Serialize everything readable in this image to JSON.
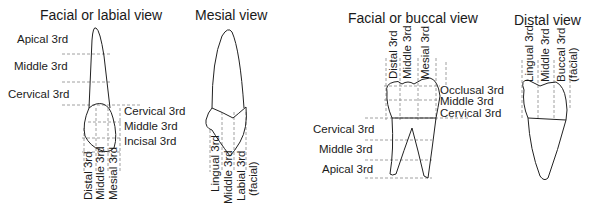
{
  "panels": [
    {
      "title": "Facial or labial view",
      "horizontal_labels": [
        "Apical 3rd",
        "Middle 3rd",
        "Cervical 3rd",
        "Cervical 3rd",
        "Middle 3rd",
        "Incisal 3rd"
      ],
      "vertical_labels": [
        "Distal 3rd",
        "Middle 3rd",
        "Mesial 3rd"
      ]
    },
    {
      "title": "Mesial view",
      "vertical_labels": [
        "Lingual 3rd",
        "Middle 3rd",
        "Labial 3rd",
        "(facial)"
      ]
    },
    {
      "title": "Facial or buccal view",
      "vertical_labels": [
        "Distal 3rd",
        "Middle 3rd",
        "Mesial 3rd"
      ],
      "horizontal_labels": [
        "Occlusal 3rd",
        "Middle 3rd",
        "Cervical 3rd",
        "Cervical 3rd",
        "Middle 3rd",
        "Apical 3rd"
      ]
    },
    {
      "title": "Distal view",
      "vertical_labels": [
        "Lingual 3rd",
        "Middle 3rd",
        "Buccal 3rd",
        "(facial)"
      ]
    }
  ]
}
